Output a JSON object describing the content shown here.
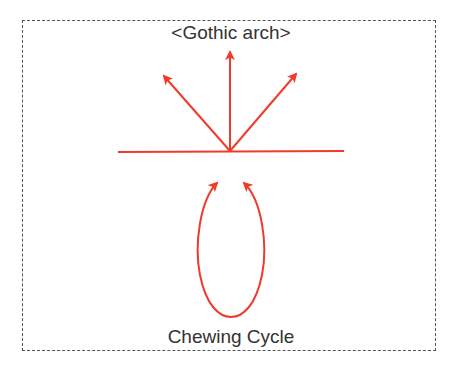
{
  "diagram": {
    "title": "<Gothic arch>",
    "caption": "Chewing Cycle",
    "colors": {
      "arrow": "#f03a2a",
      "text": "#333333",
      "border": "#555555"
    },
    "elements": [
      {
        "type": "baseline",
        "label": "horizontal reference line"
      },
      {
        "type": "arrow",
        "direction": "up-left"
      },
      {
        "type": "arrow",
        "direction": "up"
      },
      {
        "type": "arrow",
        "direction": "up-right"
      },
      {
        "type": "loop",
        "label": "chewing cycle loop with two upward arrowheads"
      }
    ]
  }
}
